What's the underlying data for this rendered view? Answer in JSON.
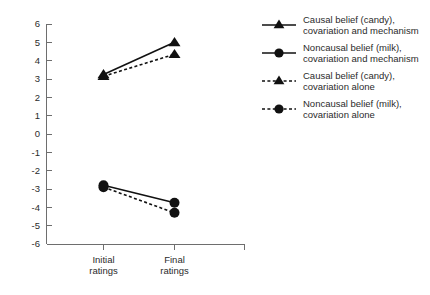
{
  "chart_data": {
    "type": "line",
    "title": "",
    "xlabel": "",
    "ylabel": "",
    "categories": [
      "Initial\nratings",
      "Final\nratings"
    ],
    "category_labels": [
      {
        "line1": "Initial",
        "line2": "ratings"
      },
      {
        "line1": "Final",
        "line2": "ratings"
      }
    ],
    "ylim": [
      -6,
      6
    ],
    "ytick_labels": [
      "6",
      "5",
      "4",
      "3",
      "2",
      "1",
      "0",
      "-1",
      "-2",
      "-3",
      "-4",
      "-5",
      "-6"
    ],
    "ytick_values": [
      6,
      5,
      4,
      3,
      2,
      1,
      0,
      -1,
      -2,
      -3,
      -4,
      -5,
      -6
    ],
    "grid": false,
    "legend_position": "right",
    "series": [
      {
        "name": "Causal belief (candy), covariation and mechanism",
        "legend_line1": "Causal belief (candy),",
        "legend_line2": "covariation and mechanism",
        "values": [
          3.25,
          5.0
        ],
        "style": "solid",
        "marker": "triangle",
        "color": "#111111"
      },
      {
        "name": "Noncausal belief (milk), covariation and mechanism",
        "legend_line1": "Noncausal belief (milk),",
        "legend_line2": "covariation and mechanism",
        "values": [
          -2.8,
          -3.75
        ],
        "style": "solid",
        "marker": "circle",
        "color": "#111111"
      },
      {
        "name": "Causal belief (candy), covariation alone",
        "legend_line1": "Causal belief (candy),",
        "legend_line2": "covariation alone",
        "values": [
          3.15,
          4.35
        ],
        "style": "dashed",
        "marker": "triangle",
        "color": "#111111"
      },
      {
        "name": "Noncausal belief (milk), covariation alone",
        "legend_line1": "Noncausal belief (milk),",
        "legend_line2": "covariation alone",
        "values": [
          -2.9,
          -4.3
        ],
        "style": "dashed",
        "marker": "circle",
        "color": "#111111"
      }
    ]
  }
}
